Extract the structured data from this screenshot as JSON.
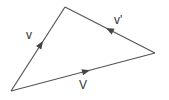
{
  "diagram": {
    "type": "vector-triangle",
    "colors": {
      "stroke": "#555555",
      "text": "#333333",
      "background": "#ffffff"
    },
    "vertices": {
      "top": [
        65,
        7
      ],
      "right": [
        155,
        53
      ],
      "bottom_left": [
        11,
        91
      ]
    },
    "edges": [
      {
        "id": "v",
        "label": "v",
        "from": "bottom_left",
        "to": "top",
        "label_pos": [
          27,
          38
        ]
      },
      {
        "id": "v-prime",
        "label": "v'",
        "from": "right",
        "to": "top",
        "label_pos": [
          115,
          22
        ]
      },
      {
        "id": "V",
        "label": "V",
        "from": "bottom_left",
        "to": "right",
        "label_pos": [
          79,
          88
        ]
      }
    ]
  }
}
